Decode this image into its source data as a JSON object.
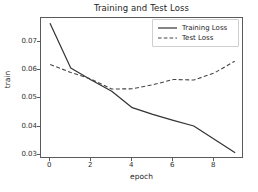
{
  "chart_data": {
    "type": "line",
    "title": "Training and Test Loss",
    "xlabel": "epoch",
    "ylabel": "train",
    "x": [
      0,
      1,
      2,
      3,
      4,
      5,
      6,
      7,
      8,
      9
    ],
    "series": [
      {
        "name": "Training Loss",
        "style": "solid",
        "color": "#333333",
        "values": [
          0.0765,
          0.0608,
          0.0565,
          0.0525,
          0.0467,
          0.0443,
          0.0422,
          0.0402,
          0.0355,
          0.0308
        ]
      },
      {
        "name": "Test Loss",
        "style": "dashed",
        "color": "#444444",
        "values": [
          0.062,
          0.0592,
          0.0568,
          0.0533,
          0.0534,
          0.0548,
          0.0567,
          0.0565,
          0.059,
          0.0632
        ]
      }
    ],
    "xlim": [
      -0.45,
      9.45
    ],
    "ylim": [
      0.0285,
      0.0785
    ],
    "xticks": [
      0,
      2,
      4,
      6,
      8
    ],
    "xtick_labels": [
      "0",
      "2",
      "4",
      "6",
      "8"
    ],
    "yticks": [
      0.03,
      0.04,
      0.05,
      0.06,
      0.07
    ],
    "ytick_labels": [
      "0.03",
      "0.04",
      "0.05",
      "0.06",
      "0.07"
    ],
    "grid": false,
    "legend_position": "upper right",
    "legend_entries": [
      "Training Loss",
      "Test Loss"
    ]
  }
}
